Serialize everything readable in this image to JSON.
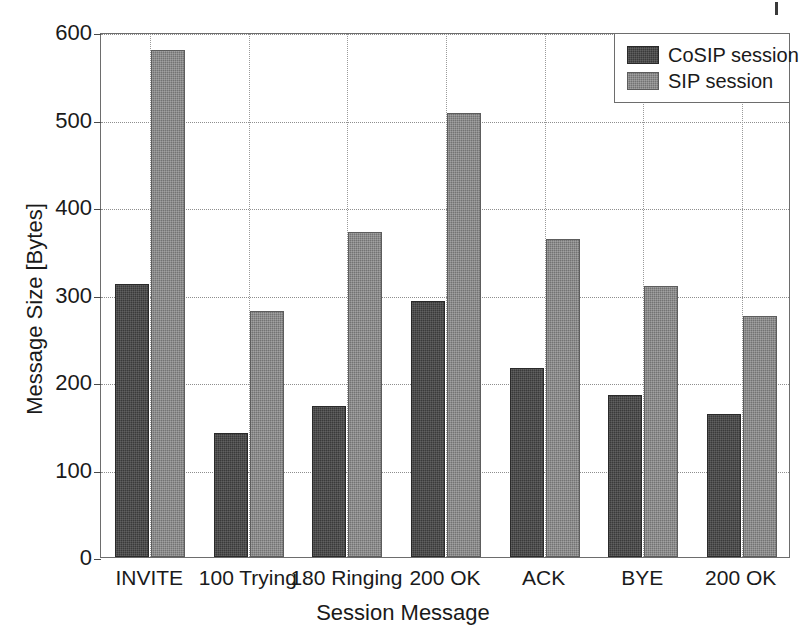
{
  "chart_data": {
    "type": "bar",
    "title": "",
    "xlabel": "Session Message",
    "ylabel": "Message Size [Bytes]",
    "categories": [
      "INVITE",
      "100 Trying",
      "180 Ringing",
      "200 OK",
      "ACK",
      "BYE",
      "200 OK"
    ],
    "series": [
      {
        "name": "CoSIP session",
        "color": "#3a3a3a",
        "values": [
          312,
          142,
          173,
          293,
          216,
          185,
          163
        ]
      },
      {
        "name": "SIP session",
        "color": "#737373",
        "values": [
          580,
          281,
          372,
          508,
          363,
          310,
          275
        ]
      }
    ],
    "ylim": [
      0,
      600
    ],
    "yticks": [
      0,
      100,
      200,
      300,
      400,
      500,
      600
    ],
    "ytick_labels": [
      "0",
      "100",
      "200",
      "300",
      "400",
      "500",
      "600"
    ],
    "grid": true,
    "grid_style": "dotted",
    "legend_position": "top-right",
    "legend": [
      "CoSIP session",
      "SIP session"
    ]
  },
  "legend": {
    "items": [
      {
        "label": "CoSIP session",
        "swatch": "cosip-swatch"
      },
      {
        "label": "SIP session",
        "swatch": "sip-swatch"
      }
    ]
  },
  "axes": {
    "x_title": "Session Message",
    "y_title": "Message Size [Bytes]",
    "y_ticks": [
      "600",
      "500",
      "400",
      "300",
      "200",
      "100",
      "0"
    ],
    "x_ticks": [
      "INVITE",
      "100 Trying",
      "180 Ringing",
      "200 OK",
      "ACK",
      "BYE",
      "200 OK"
    ]
  }
}
